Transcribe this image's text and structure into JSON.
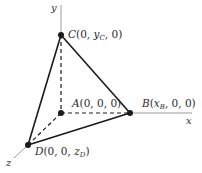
{
  "diagram": {
    "type": "3d-tetrahedron-coordinate-diagram",
    "axes": {
      "x": {
        "label": "x"
      },
      "y": {
        "label": "y"
      },
      "z": {
        "label": "z"
      }
    },
    "points": {
      "A": {
        "name": "A",
        "coords": "(0, 0, 0)"
      },
      "B": {
        "name": "B",
        "pre": "(",
        "var": "x",
        "sub": "B",
        "post": ", 0, 0)"
      },
      "C": {
        "name": "C",
        "pre": "(0, ",
        "var": "y",
        "sub": "C",
        "post": ", 0)"
      },
      "D": {
        "name": "D",
        "pre": "(0, 0, ",
        "var": "z",
        "sub": "D",
        "post": ")"
      }
    },
    "edges": {
      "solid": [
        "C-B",
        "C-D",
        "D-B"
      ],
      "dashed": [
        "A-C",
        "A-B",
        "A-D"
      ]
    },
    "colors": {
      "edge": "#1a1a1a",
      "axis": "#9a9a9a",
      "text": "#2a2a2a"
    }
  }
}
